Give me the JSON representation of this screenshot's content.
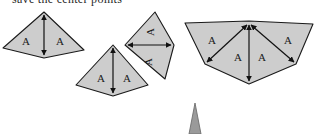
{
  "figure": {
    "caption_partial": "save the center points",
    "colors": {
      "fill": "#cdcdcd",
      "stroke": "#1a1a1a",
      "caption": "#2a2a2a",
      "background": "#ffffff",
      "spike_fill": "#9a9a9a"
    },
    "region_label": "A",
    "groups": [
      {
        "name": "single-kite",
        "labels": [
          "A",
          "A"
        ],
        "arrow": "vertical-double-headed"
      },
      {
        "name": "two-kites-hinged",
        "labels": [
          "A",
          "A",
          "A",
          "A"
        ],
        "arrows": [
          "vertical-double-headed",
          "horizontal-double-headed"
        ]
      },
      {
        "name": "four-triangle-fan",
        "labels": [
          "A",
          "A",
          "A",
          "A"
        ],
        "arrows": [
          "radial-upper-left",
          "radial-lower-left",
          "radial-vertical",
          "radial-lower-right",
          "radial-upper-right"
        ]
      },
      {
        "name": "narrow-spike",
        "labels": []
      }
    ]
  }
}
